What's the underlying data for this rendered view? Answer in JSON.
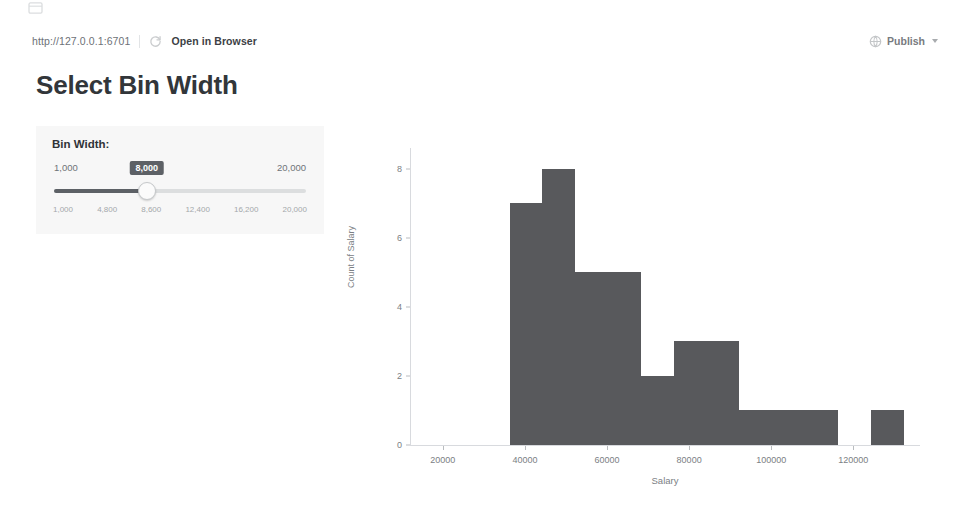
{
  "toolbar": {
    "url": "http://127.0.0.1:6701",
    "refresh_icon": "refresh-icon",
    "open_in_browser_label": "Open in Browser",
    "publish_icon": "publish-icon",
    "publish_label": "Publish",
    "caret_icon": "chevron-down-icon",
    "corner_icon": "window-icon"
  },
  "page": {
    "title": "Select Bin Width"
  },
  "slider": {
    "label": "Bin Width:",
    "min_label": "1,000",
    "max_label": "20,000",
    "value_label": "8,000",
    "min": 1000,
    "max": 20000,
    "value": 8000,
    "fill_percent": 37,
    "tick_labels": [
      "1,000",
      "4,800",
      "8,600",
      "12,400",
      "16,200",
      "20,000"
    ],
    "track_color": "#5d6166",
    "panel_bg": "#f7f7f7"
  },
  "chart_data": {
    "type": "bar",
    "title": "",
    "xlabel": "Salary",
    "ylabel": "Count of Salary",
    "bar_color": "#58595c",
    "grid": false,
    "legend": "none",
    "bin_width": 8000,
    "xlim": [
      12000,
      136000
    ],
    "ylim": [
      0,
      8.6
    ],
    "xticks": [
      20000,
      40000,
      60000,
      80000,
      100000,
      120000
    ],
    "xtick_labels": [
      "20000",
      "40000",
      "60000",
      "80000",
      "100000",
      "120000"
    ],
    "yticks": [
      0,
      2,
      4,
      6,
      8
    ],
    "ytick_labels": [
      "0",
      "2",
      "4",
      "6",
      "8"
    ],
    "bins": [
      {
        "start": 36000,
        "end": 44000,
        "count": 7
      },
      {
        "start": 44000,
        "end": 52000,
        "count": 8
      },
      {
        "start": 52000,
        "end": 60000,
        "count": 5
      },
      {
        "start": 60000,
        "end": 68000,
        "count": 5
      },
      {
        "start": 68000,
        "end": 76000,
        "count": 2
      },
      {
        "start": 76000,
        "end": 84000,
        "count": 3
      },
      {
        "start": 84000,
        "end": 92000,
        "count": 3
      },
      {
        "start": 92000,
        "end": 100000,
        "count": 1
      },
      {
        "start": 100000,
        "end": 108000,
        "count": 1
      },
      {
        "start": 108000,
        "end": 116000,
        "count": 1
      },
      {
        "start": 116000,
        "end": 124000,
        "count": 0
      },
      {
        "start": 124000,
        "end": 132000,
        "count": 1
      }
    ]
  }
}
